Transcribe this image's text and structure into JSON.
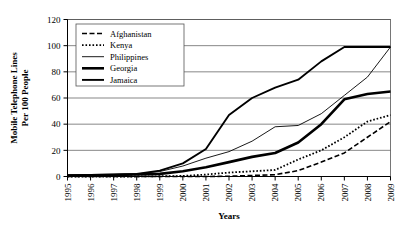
{
  "chart_data": {
    "type": "line",
    "title": "",
    "xlabel": "Years",
    "ylabel": "Mobile Telephone Lines Per 100 People",
    "ylabel_line1": "Mobile Telephone Lines",
    "ylabel_line2": "Per 100 People",
    "x": [
      1995,
      1996,
      1997,
      1998,
      1999,
      2000,
      2001,
      2002,
      2003,
      2004,
      2005,
      2006,
      2007,
      2008,
      2009
    ],
    "categories": [
      "1995",
      "1996",
      "1997",
      "1998",
      "1999",
      "2000",
      "2001",
      "2002",
      "2003",
      "2004",
      "2005",
      "2006",
      "2007",
      "2008",
      "2009"
    ],
    "ylim": [
      0,
      120
    ],
    "yticks": [
      0,
      20,
      40,
      60,
      80,
      100,
      120
    ],
    "ytick_labels": [
      "0",
      "20",
      "40",
      "60",
      "80",
      "100",
      "120"
    ],
    "grid": true,
    "grid_axis": "y",
    "legend_position": "upper-left",
    "series": [
      {
        "name": "Afghanistan",
        "style": "dashed",
        "width": 1.6,
        "color": "#000000",
        "values": [
          0,
          0,
          0,
          0,
          0,
          0,
          0,
          0.2,
          0.8,
          1.4,
          4.5,
          11,
          18,
          30,
          42
        ]
      },
      {
        "name": "Kenya",
        "style": "dotted",
        "width": 1.8,
        "color": "#000000",
        "values": [
          0,
          0,
          0,
          0,
          0.2,
          0.4,
          1.5,
          3,
          4,
          5,
          13,
          20,
          30,
          42,
          47
        ]
      },
      {
        "name": "Philippines",
        "style": "solid",
        "width": 0.9,
        "color": "#000000",
        "values": [
          0.7,
          1,
          1.5,
          2,
          3.8,
          8,
          14,
          19,
          27,
          38,
          39,
          48,
          62,
          76,
          99
        ]
      },
      {
        "name": "Georgia",
        "style": "solid",
        "width": 2.6,
        "color": "#000000",
        "values": [
          0.8,
          1,
          1.2,
          1.5,
          2,
          4,
          7,
          11,
          15,
          18,
          26,
          40,
          59,
          63,
          65
        ]
      },
      {
        "name": "Jamaica",
        "style": "solid",
        "width": 1.9,
        "color": "#000000",
        "values": [
          1,
          1.2,
          1.5,
          2,
          4.5,
          10,
          21,
          47,
          60,
          68,
          74,
          88,
          99,
          99,
          99
        ]
      }
    ]
  }
}
